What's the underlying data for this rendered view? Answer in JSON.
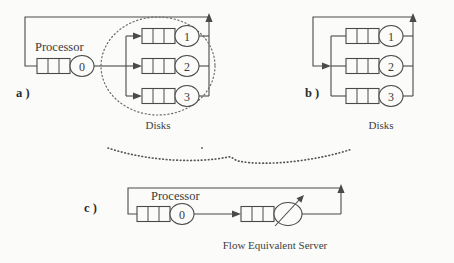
{
  "figure": {
    "background_color": "#fbfbf9",
    "line_color": "#4a4a4a",
    "text_color": "#3a3a3a"
  },
  "panels": [
    {
      "id": "a",
      "label": "a )",
      "processor_label": "Processor",
      "processor_node": "0",
      "subsystem_caption": "Disks",
      "subsystem_highlight": "dotted-ellipse",
      "disks": [
        {
          "node": "1",
          "queue_cells": 3
        },
        {
          "node": "2",
          "queue_cells": 3
        },
        {
          "node": "3",
          "queue_cells": 3
        }
      ],
      "processor_queue_cells": 3
    },
    {
      "id": "b",
      "label": "b )",
      "subsystem_caption": "Disks",
      "disks": [
        {
          "node": "1",
          "queue_cells": 3
        },
        {
          "node": "2",
          "queue_cells": 3
        },
        {
          "node": "3",
          "queue_cells": 3
        }
      ]
    },
    {
      "id": "c",
      "label": "c )",
      "processor_label": "Processor",
      "processor_node": "0",
      "processor_queue_cells": 3,
      "fes_caption": "Flow  Equivalent  Server",
      "fes_queue_cells": 3,
      "fes_symbol": "variable-rate-server"
    }
  ],
  "separator": {
    "style": "dotted-curve",
    "color": "#555555"
  }
}
